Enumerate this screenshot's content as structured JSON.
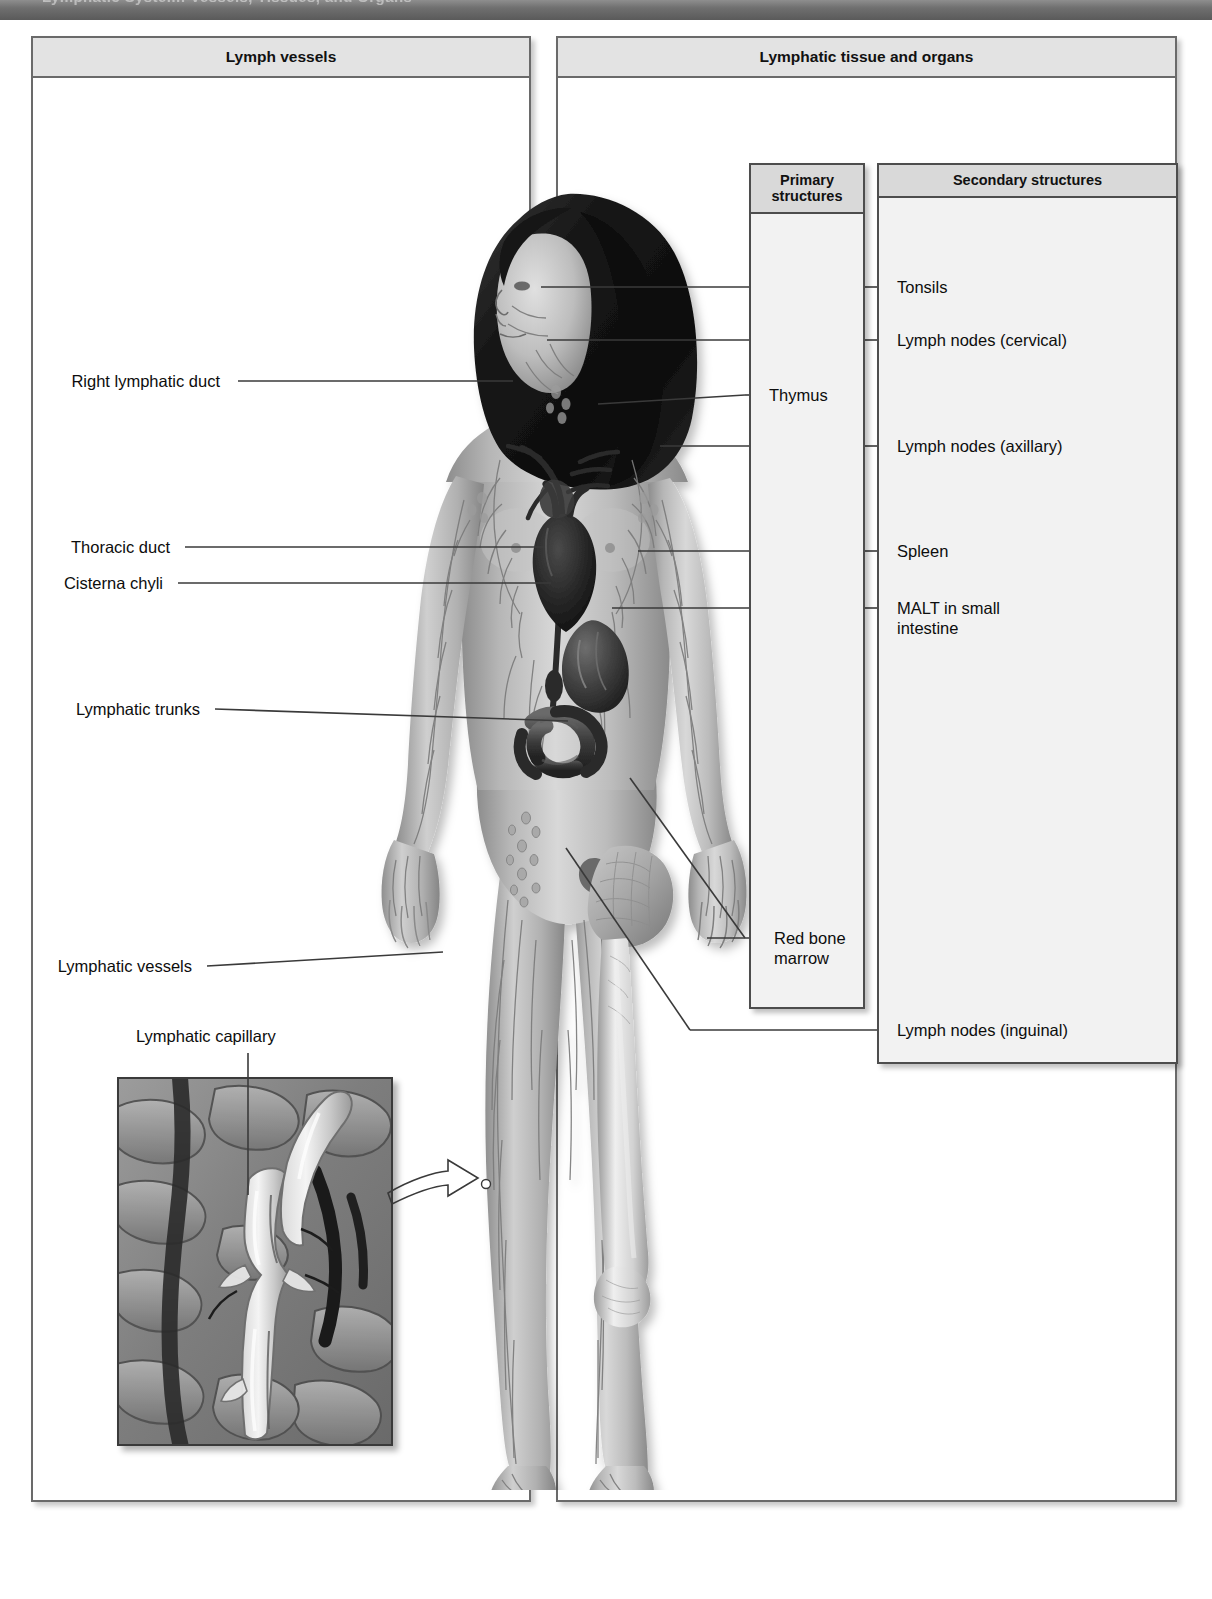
{
  "topbar": {
    "clipped_title": "Lymphatic System: Vessels, Tissues, and Organs"
  },
  "panels": {
    "left": {
      "title": "Lymph vessels"
    },
    "right": {
      "title": "Lymphatic tissue and organs"
    }
  },
  "boxes": {
    "primary": {
      "title": "Primary\nstructures"
    },
    "secondary": {
      "title": "Secondary\nstructures"
    }
  },
  "labels_left": [
    {
      "id": "right-lymphatic-duct",
      "text": "Right lymphatic duct"
    },
    {
      "id": "thoracic-duct",
      "text": "Thoracic duct"
    },
    {
      "id": "cisterna-chyli",
      "text": "Cisterna chyli"
    },
    {
      "id": "lymphatic-trunks",
      "text": "Lymphatic trunks"
    },
    {
      "id": "lymphatic-vessels",
      "text": "Lymphatic vessels"
    },
    {
      "id": "lymphatic-capillary",
      "text": "Lymphatic capillary"
    }
  ],
  "labels_primary": [
    {
      "id": "thymus",
      "text": "Thymus"
    },
    {
      "id": "red-bone-marrow",
      "text": "Red bone\nmarrow"
    }
  ],
  "labels_secondary": [
    {
      "id": "tonsils",
      "text": "Tonsils"
    },
    {
      "id": "lymph-nodes-cervical",
      "text": "Lymph nodes (cervical)"
    },
    {
      "id": "lymph-nodes-axillary",
      "text": "Lymph nodes (axillary)"
    },
    {
      "id": "spleen",
      "text": "Spleen"
    },
    {
      "id": "malt-small-intestine",
      "text": "MALT in small\nintestine"
    },
    {
      "id": "lymph-nodes-inguinal",
      "text": "Lymph nodes (inguinal)"
    }
  ],
  "colors": {
    "topbar": "#6f6f6f",
    "panel_border": "#6a6a6a",
    "panel_head_fill": "#e3e3e3",
    "box_fill": "#f2f2f2",
    "box_head_fill": "#d9d9d9",
    "leader_line": "#3a3a3a",
    "text": "#0d0d0d"
  }
}
